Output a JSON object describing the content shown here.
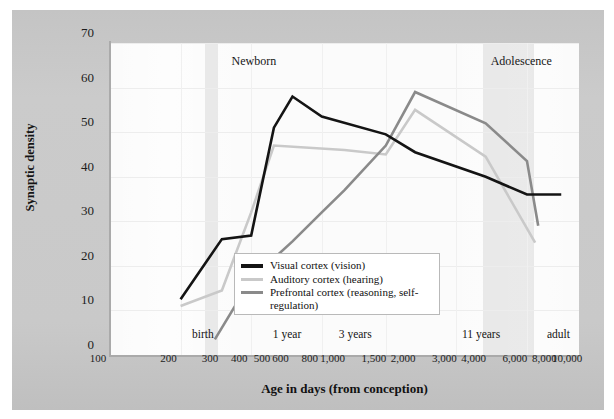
{
  "chart_data": {
    "type": "line",
    "title": "",
    "xlabel": "Age in days (from conception)",
    "ylabel": "Synaptic density",
    "xscale": "log",
    "xlim": [
      100,
      10000
    ],
    "ylim": [
      0,
      70
    ],
    "grid": true,
    "legend_position": "center",
    "xticks": [
      100,
      200,
      300,
      400,
      500,
      600,
      800,
      1000,
      1500,
      2000,
      3000,
      4000,
      6000,
      8000,
      10000
    ],
    "xticklabels": [
      "100",
      "200",
      "300",
      "400",
      "500",
      "600",
      "800",
      "1,000",
      "1,500",
      "2,000",
      "3,000",
      "4,000",
      "6,000",
      "8,000",
      "10,000"
    ],
    "yticks": [
      0,
      10,
      20,
      30,
      40,
      50,
      60,
      70
    ],
    "yticklabels": [
      "0",
      "10",
      "20",
      "30",
      "40",
      "50",
      "60",
      "70"
    ],
    "annotations": [
      {
        "text": "Newborn",
        "x": 330,
        "y": 66
      },
      {
        "text": "Adolescence",
        "x": 4200,
        "y": 66
      }
    ],
    "milestones": [
      {
        "text": "birth",
        "x": 280
      },
      {
        "text": "1 year",
        "x": 640
      },
      {
        "text": "3 years",
        "x": 1250
      },
      {
        "text": "11 years",
        "x": 4300
      },
      {
        "text": "adult",
        "x": 9200
      }
    ],
    "bands": [
      {
        "name": "birth-band",
        "x0": 255,
        "x1": 290
      },
      {
        "name": "adolescence-band",
        "x0": 3900,
        "x1": 6400
      }
    ],
    "series": [
      {
        "name": "Visual cortex (vision)",
        "color": "#141414",
        "width": 2.6,
        "x": [
          200,
          300,
          400,
          500,
          600,
          800,
          1500,
          2000,
          4000,
          6000,
          8400
        ],
        "y": [
          12.5,
          26,
          26.8,
          51,
          58,
          53.5,
          49.5,
          45.5,
          40,
          36,
          36
        ]
      },
      {
        "name": "Auditory cortex (hearing)",
        "color": "#c9c9c9",
        "width": 2.6,
        "x": [
          200,
          300,
          400,
          500,
          1000,
          1500,
          2000,
          4000,
          6500
        ],
        "y": [
          11,
          14.5,
          32,
          47,
          46,
          45,
          55,
          44.5,
          25.2
        ]
      },
      {
        "name": "Prefrontal cortex (reasoning, self-regulation)",
        "color": "#8a8a8a",
        "width": 2.6,
        "x": [
          280,
          400,
          600,
          800,
          1000,
          1500,
          2000,
          4000,
          6000,
          6700
        ],
        "y": [
          3.5,
          17,
          25.5,
          32,
          37,
          47,
          59,
          52,
          43.5,
          29
        ]
      }
    ]
  },
  "legend": {
    "items": [
      {
        "label": "Visual cortex (vision)",
        "color": "#141414"
      },
      {
        "label": "Auditory cortex (hearing)",
        "color": "#c9c9c9"
      },
      {
        "label": "Prefrontal cortex (reasoning, self-regulation)",
        "color": "#8a8a8a"
      }
    ]
  }
}
